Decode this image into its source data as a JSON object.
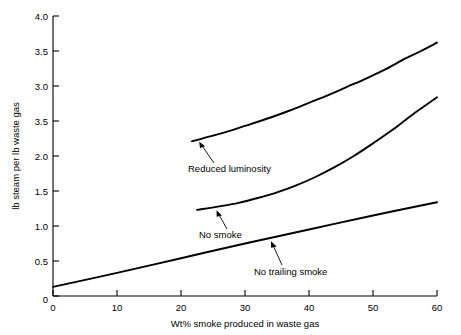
{
  "chart_data": {
    "type": "line",
    "title": "",
    "xlabel": "Wt% smoke produced in waste gas",
    "ylabel": "lb steam per lb waste gas",
    "xlim": [
      0,
      60
    ],
    "ylim": [
      0,
      4.0
    ],
    "grid": false,
    "legend": "none (curves labeled inline with leader arrows)",
    "xticks": [
      "0",
      "10",
      "20",
      "30",
      "40",
      "50",
      "60"
    ],
    "xtick_values": [
      0,
      10,
      20,
      30,
      40,
      50,
      60
    ],
    "yticks": [
      "0",
      "0.5",
      "1.0",
      "1.5",
      "2.0",
      "3.5",
      "3.0",
      "3.5",
      "4.0"
    ],
    "ytick_values": [
      0,
      0.5,
      1.0,
      1.5,
      2.0,
      2.5,
      3.0,
      3.5,
      4.0
    ],
    "ytick_note": "Label at the 2.5 position reads '3.5' in the original figure (typographic error reproduced as shown).",
    "series": [
      {
        "name": "Reduced luminosity",
        "x": [
          21.7,
          25,
          28,
          31,
          34,
          37,
          40,
          43,
          46,
          49,
          52,
          55,
          57.5,
          60
        ],
        "values": [
          2.21,
          2.29,
          2.37,
          2.46,
          2.55,
          2.65,
          2.76,
          2.87,
          2.99,
          3.11,
          3.24,
          3.39,
          3.5,
          3.62
        ]
      },
      {
        "name": "No smoke",
        "x": [
          22.5,
          26,
          29,
          32,
          35,
          38,
          41,
          44,
          47,
          50,
          53,
          56,
          58,
          60
        ],
        "values": [
          1.23,
          1.28,
          1.33,
          1.4,
          1.48,
          1.58,
          1.7,
          1.84,
          2.0,
          2.18,
          2.37,
          2.58,
          2.71,
          2.84
        ]
      },
      {
        "name": "No trailing smoke",
        "x": [
          0,
          10,
          20,
          30,
          40,
          50,
          60
        ],
        "values": [
          0.13,
          0.33,
          0.54,
          0.75,
          0.95,
          1.15,
          1.34
        ]
      }
    ],
    "annotations": [
      {
        "label": "Reduced luminosity",
        "series": "Reduced luminosity",
        "point_x": 23.0,
        "point_y": 2.26
      },
      {
        "label": "No smoke",
        "series": "No smoke",
        "point_x": 25.5,
        "point_y": 1.275
      },
      {
        "label": "No trailing smoke",
        "series": "No trailing smoke",
        "point_x": 34.0,
        "point_y": 0.83
      }
    ]
  }
}
